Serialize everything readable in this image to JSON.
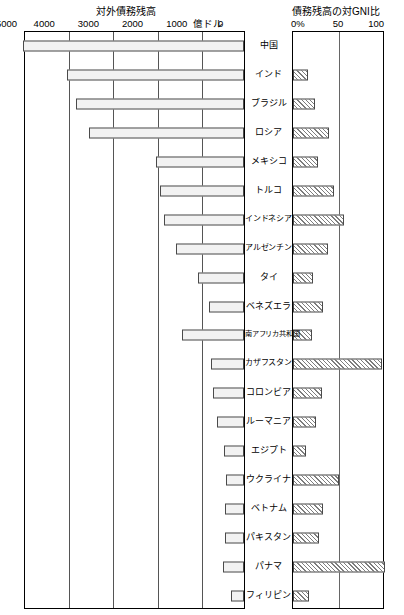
{
  "left_chart": {
    "title": "対外債務残高",
    "unit_label": "億ドル",
    "ticks": [
      "5000",
      "4000",
      "3000",
      "2000",
      "1000",
      "0"
    ],
    "tick_values": [
      5000,
      4000,
      3000,
      2000,
      1000,
      0
    ],
    "axis_max": 5000,
    "axis_min": 0
  },
  "right_chart": {
    "title": "債務残高の対GNI比",
    "ticks": [
      "0%",
      "50",
      "100"
    ],
    "tick_values": [
      0,
      50,
      100
    ],
    "axis_max": 100,
    "axis_min": 0
  },
  "countries": [
    "中国",
    "インド",
    "ブラジル",
    "ロシア",
    "メキシコ",
    "トルコ",
    "インドネシア",
    "アルゼンチン",
    "タイ",
    "ベネズエラ",
    "南アフリカ共和国",
    "カザフスタン",
    "コロンビア",
    "ルーマニア",
    "エジプト",
    "ウクライナ",
    "ベトナム",
    "パキスタン",
    "パナマ",
    "フィリピン"
  ],
  "chart_data": {
    "type": "bar",
    "orientation": "horizontal",
    "layout": "back-to-back paired panels",
    "categories": [
      "中国",
      "インド",
      "ブラジル",
      "ロシア",
      "メキシコ",
      "トルコ",
      "インドネシア",
      "アルゼンチン",
      "タイ",
      "ベネズエラ",
      "南アフリカ共和国",
      "カザフスタン",
      "コロンビア",
      "ルーマニア",
      "エジプト",
      "ウクライナ",
      "ベトナム",
      "パキスタン",
      "パナマ",
      "フィリピン"
    ],
    "series": [
      {
        "name": "対外債務残高",
        "panel": "left",
        "unit": "億ドル",
        "direction": "right-to-left",
        "xlabel": "億ドル",
        "xlim": [
          0,
          5000
        ],
        "ticks": [
          5000,
          4000,
          3000,
          2000,
          1000,
          0
        ],
        "values": [
          5000,
          4000,
          3800,
          3500,
          2000,
          1900,
          1800,
          1550,
          1050,
          800,
          1400,
          750,
          700,
          620,
          450,
          400,
          430,
          420,
          480,
          300
        ]
      },
      {
        "name": "債務残高の対GNI比",
        "panel": "right",
        "unit": "%",
        "direction": "left-to-right",
        "xlabel": "%",
        "xlim": [
          0,
          100
        ],
        "ticks": [
          0,
          50,
          100
        ],
        "values": [
          0,
          16,
          24,
          39,
          27,
          45,
          55,
          38,
          22,
          33,
          21,
          97,
          31,
          25,
          14,
          50,
          33,
          28,
          100,
          17
        ]
      }
    ],
    "grid": true,
    "legend": "none"
  }
}
